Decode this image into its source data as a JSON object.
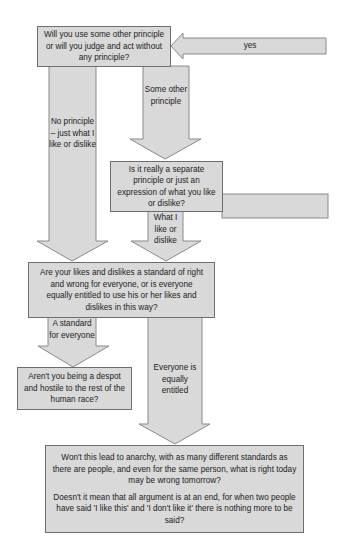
{
  "diagram": {
    "type": "flowchart",
    "colors": {
      "fill": "#d9d9d9",
      "border": "#6e6e6e",
      "text": "#222222"
    },
    "boxes": {
      "q_principle": "Will you use some other principle or will you judge and act without any principle?",
      "q_separate": "Is it really a separate principle or just an expression of what you like or dislike?",
      "q_standard": "Are your likes and dislikes a standard of right and wrong for everyone, or is everyone equally entitled to use his or her likes and dislikes in this way?",
      "q_despot": "Aren't you being a despot and hostile to the rest of the human race?",
      "q_anarchy_1": "Won't this lead to anarchy, with as many different standards as there are people, and even for the same person, what is right today may be wrong tomorrow?",
      "q_anarchy_2": "Doesn't it mean that all argument is at an end, for when two people have said 'I like this' and 'I don't like it' there is nothing more to be said?"
    },
    "arrows": {
      "yes": "yes",
      "no_principle": "No principle – just what I like or dislike",
      "some_other": "Some other principle",
      "what_i_like": "What I like or dislike",
      "standard_everyone": "A standard for everyone",
      "equally_entitled": "Everyone is equally entitled"
    }
  }
}
